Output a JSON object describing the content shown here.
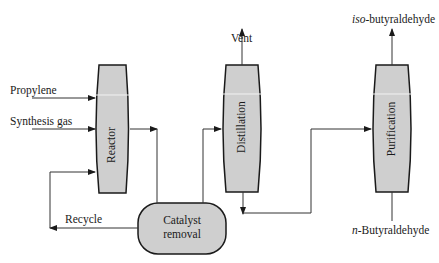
{
  "diagram": {
    "type": "process-flow",
    "colors": {
      "vessel_fill": "#cfcfcf",
      "vessel_stroke": "#1a1a1a",
      "line": "#333333",
      "highlight": "#f2f2f2"
    },
    "inputs": {
      "propylene": "Propylene",
      "synthesis_gas": "Synthesis gas",
      "recycle": "Recycle"
    },
    "units": {
      "reactor": "Reactor",
      "catalyst_removal_line1": "Catalyst",
      "catalyst_removal_line2": "removal",
      "distillation": "Distillation",
      "purification": "Purification"
    },
    "outputs": {
      "vent": "Vent",
      "iso_prefix": "iso",
      "iso_suffix": "-butyraldehyde",
      "n_prefix": "n",
      "n_suffix": "-Butyraldehyde"
    }
  }
}
